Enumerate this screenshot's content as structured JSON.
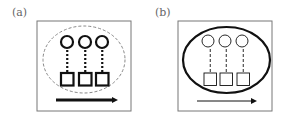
{
  "panels": [
    {
      "label": "(a)",
      "frame": {
        "x": 37,
        "y": 21,
        "w": 94,
        "h": 90
      },
      "ellipse": {
        "cx": 84,
        "cy": 59.5,
        "rx": 41,
        "ry": 33.5,
        "style": "dashed",
        "stroke": "#888888",
        "width": 1
      },
      "circles": [
        {
          "cx": 67,
          "cy": 42
        },
        {
          "cx": 85,
          "cy": 42
        },
        {
          "cx": 102,
          "cy": 42
        }
      ],
      "circle_r": 6,
      "circle_stroke_width": 2.2,
      "squares": [
        {
          "x": 61,
          "y": 73
        },
        {
          "x": 79,
          "y": 73
        },
        {
          "x": 96,
          "y": 73
        }
      ],
      "square_size": 12.5,
      "square_stroke_width": 2.2,
      "connector_style": "dotted",
      "connector_width": 2.2,
      "arrow": {
        "x1": 56,
        "x2": 118,
        "y": 100,
        "width": 3
      }
    },
    {
      "label": "(b)",
      "frame": {
        "x": 178,
        "y": 21,
        "w": 94,
        "h": 90
      },
      "ellipse": {
        "cx": 226.5,
        "cy": 60,
        "rx": 43.5,
        "ry": 33,
        "style": "solid",
        "stroke": "#111111",
        "width": 2.2
      },
      "circles": [
        {
          "cx": 208,
          "cy": 41
        },
        {
          "cx": 225,
          "cy": 41
        },
        {
          "cx": 242,
          "cy": 41
        }
      ],
      "circle_r": 6,
      "circle_stroke_width": 0.9,
      "squares": [
        {
          "x": 204,
          "y": 73
        },
        {
          "x": 220,
          "y": 73
        },
        {
          "x": 237,
          "y": 73
        }
      ],
      "square_size": 12.5,
      "square_stroke_width": 0.9,
      "connector_style": "dashed",
      "connector_width": 0.9,
      "arrow": {
        "x1": 197,
        "x2": 257,
        "y": 101,
        "width": 1
      }
    }
  ],
  "colors": {
    "frame": "#777777",
    "stroke": "#111111"
  }
}
